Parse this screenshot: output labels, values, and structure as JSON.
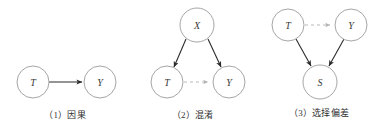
{
  "figure": {
    "background_color": "#ffffff",
    "node_stroke_color": "#9b9b9b",
    "node_fill_color": "#ffffff",
    "node_label_color": "#3a3a3a",
    "solid_edge_color": "#2b2b2b",
    "dashed_edge_color": "#b9b9b9"
  },
  "panels": [
    {
      "id": "panel-causation",
      "caption": "（1）因果",
      "nodes": [
        {
          "id": "p1-T",
          "label": "T",
          "cx": 33,
          "cy": 82,
          "r": 16
        },
        {
          "id": "p1-Y",
          "label": "Y",
          "cx": 100,
          "cy": 82,
          "r": 16
        }
      ],
      "edges": [
        {
          "id": "p1-T-to-Y",
          "from": "T",
          "to": "Y",
          "style": "solid",
          "arrow": "end"
        }
      ]
    },
    {
      "id": "panel-confounding",
      "caption": "（2）混淆",
      "nodes": [
        {
          "id": "p2-X",
          "label": "X",
          "cx": 197,
          "cy": 25,
          "r": 17
        },
        {
          "id": "p2-T",
          "label": "T",
          "cx": 167,
          "cy": 82,
          "r": 16
        },
        {
          "id": "p2-Y",
          "label": "Y",
          "cx": 229,
          "cy": 82,
          "r": 16
        }
      ],
      "edges": [
        {
          "id": "p2-X-to-T",
          "from": "X",
          "to": "T",
          "style": "solid",
          "arrow": "end"
        },
        {
          "id": "p2-X-to-Y",
          "from": "X",
          "to": "Y",
          "style": "solid",
          "arrow": "end"
        },
        {
          "id": "p2-T-to-Y",
          "from": "T",
          "to": "Y",
          "style": "dashed",
          "arrow": "end"
        }
      ]
    },
    {
      "id": "panel-selection-bias",
      "caption": "（3）选择偏差",
      "nodes": [
        {
          "id": "p3-T",
          "label": "T",
          "cx": 288,
          "cy": 25,
          "r": 16
        },
        {
          "id": "p3-Y",
          "label": "Y",
          "cx": 351,
          "cy": 25,
          "r": 16
        },
        {
          "id": "p3-S",
          "label": "S",
          "cx": 320,
          "cy": 82,
          "r": 17
        }
      ],
      "edges": [
        {
          "id": "p3-T-to-Y",
          "from": "T",
          "to": "Y",
          "style": "dashed",
          "arrow": "end"
        },
        {
          "id": "p3-T-to-S",
          "from": "T",
          "to": "S",
          "style": "solid",
          "arrow": "end"
        },
        {
          "id": "p3-Y-to-S",
          "from": "Y",
          "to": "S",
          "style": "solid",
          "arrow": "end"
        }
      ]
    }
  ]
}
